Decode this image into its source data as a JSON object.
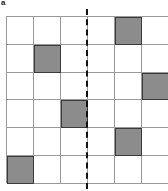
{
  "panel_label": "a",
  "grid": {
    "rows": 6,
    "cols": 6,
    "filled_color": "#8c8c8c",
    "empty_color": "#ffffff",
    "line_color": "#9a9a9a",
    "filled_cells": [
      {
        "row": 0,
        "col": 4
      },
      {
        "row": 1,
        "col": 1
      },
      {
        "row": 2,
        "col": 5
      },
      {
        "row": 3,
        "col": 2
      },
      {
        "row": 4,
        "col": 4
      },
      {
        "row": 5,
        "col": 0
      }
    ]
  },
  "divider": {
    "style": "dashed",
    "position": "between column 3 and column 4"
  }
}
